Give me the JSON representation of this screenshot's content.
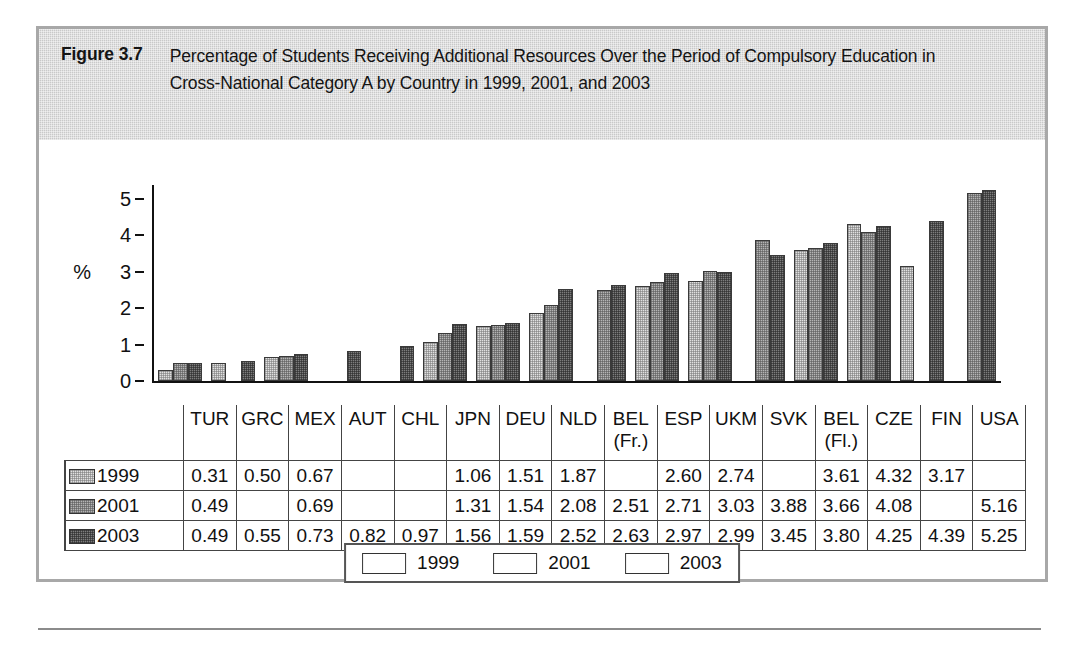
{
  "figure": {
    "label": "Figure 3.7",
    "caption": "Percentage of Students Receiving Additional Resources Over the Period of Compulsory Education in Cross-National Category A by Country in 1999, 2001, and 2003"
  },
  "chart_data": {
    "type": "bar",
    "title": "Percentage of Students Receiving Additional Resources Over the Period of Compulsory Education in Cross-National Category A by Country in 1999, 2001, and 2003",
    "xlabel": "",
    "ylabel": "%",
    "ylim": [
      0,
      5.6
    ],
    "yticks": [
      0,
      1,
      2,
      3,
      4,
      5
    ],
    "ytick_labels": [
      "0",
      "1",
      "2",
      "3",
      "4",
      "5"
    ],
    "grid": false,
    "legend_position": "bottom-center",
    "categories": [
      "TUR",
      "GRC",
      "MEX",
      "AUT",
      "CHL",
      "JPN",
      "DEU",
      "NLD",
      "BEL (Fr.)",
      "ESP",
      "UKM",
      "SVK",
      "BEL (Fl.)",
      "CZE",
      "FIN",
      "USA"
    ],
    "category_lines": [
      [
        "TUR"
      ],
      [
        "GRC"
      ],
      [
        "MEX"
      ],
      [
        "AUT"
      ],
      [
        "CHL"
      ],
      [
        "JPN"
      ],
      [
        "DEU"
      ],
      [
        "NLD"
      ],
      [
        "BEL",
        "(Fr.)"
      ],
      [
        "ESP"
      ],
      [
        "UKM"
      ],
      [
        "SVK"
      ],
      [
        "BEL",
        "(Fl.)"
      ],
      [
        "CZE"
      ],
      [
        "FIN"
      ],
      [
        "USA"
      ]
    ],
    "series": [
      {
        "name": "1999",
        "color": "#e0e0e0",
        "values": [
          0.31,
          0.5,
          0.67,
          null,
          null,
          1.06,
          1.51,
          1.87,
          null,
          2.6,
          2.74,
          null,
          3.61,
          4.32,
          3.17,
          null
        ],
        "labels": [
          "0.31",
          "0.50",
          "0.67",
          "",
          "",
          "1.06",
          "1.51",
          "1.87",
          "",
          "2.60",
          "2.74",
          "",
          "3.61",
          "4.32",
          "3.17",
          ""
        ]
      },
      {
        "name": "2001",
        "color": "#b4b4b4",
        "values": [
          0.49,
          null,
          0.69,
          null,
          null,
          1.31,
          1.54,
          2.08,
          2.51,
          2.71,
          3.03,
          3.88,
          3.66,
          4.08,
          null,
          5.16
        ],
        "labels": [
          "0.49",
          "",
          "0.69",
          "",
          "",
          "1.31",
          "1.54",
          "2.08",
          "2.51",
          "2.71",
          "3.03",
          "3.88",
          "3.66",
          "4.08",
          "",
          "5.16"
        ]
      },
      {
        "name": "2003",
        "color": "#7d7d7d",
        "values": [
          0.49,
          0.55,
          0.73,
          0.82,
          0.97,
          1.56,
          1.59,
          2.52,
          2.63,
          2.97,
          2.99,
          3.45,
          3.8,
          4.25,
          4.39,
          5.25
        ],
        "labels": [
          "0.49",
          "0.55",
          "0.73",
          "0.82",
          "0.97",
          "1.56",
          "1.59",
          "2.52",
          "2.63",
          "2.97",
          "2.99",
          "3.45",
          "3.80",
          "4.25",
          "4.39",
          "5.25"
        ]
      }
    ]
  },
  "legend": {
    "entries": [
      {
        "label": "1999",
        "color": "#e0e0e0"
      },
      {
        "label": "2001",
        "color": "#b4b4b4"
      },
      {
        "label": "2003",
        "color": "#7d7d7d"
      }
    ]
  }
}
